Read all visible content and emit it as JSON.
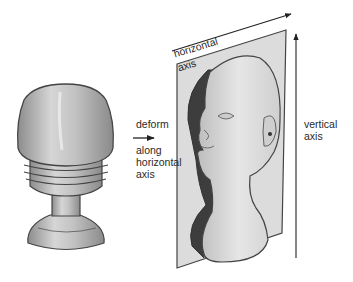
{
  "figure": {
    "left_object": "solid-of-revolution (rounded cap, grooved rings, stem, flared base)",
    "right_object": "head bust on a plane",
    "labels": {
      "deform": "deform",
      "along_line1": "along",
      "along_line2": "horizontal",
      "along_line3": "axis",
      "horizontal": "horizontal",
      "horizontal_axis": "axis",
      "vertical_line1": "vertical",
      "vertical_line2": "axis"
    }
  },
  "colors": {
    "stroke": "#333333",
    "plane_fill": "#d9d9d9",
    "object_fill": "#bdbdbd",
    "shadow": "#3a3a3a",
    "highlight": "#ececec",
    "text": "#2a2a2a"
  }
}
